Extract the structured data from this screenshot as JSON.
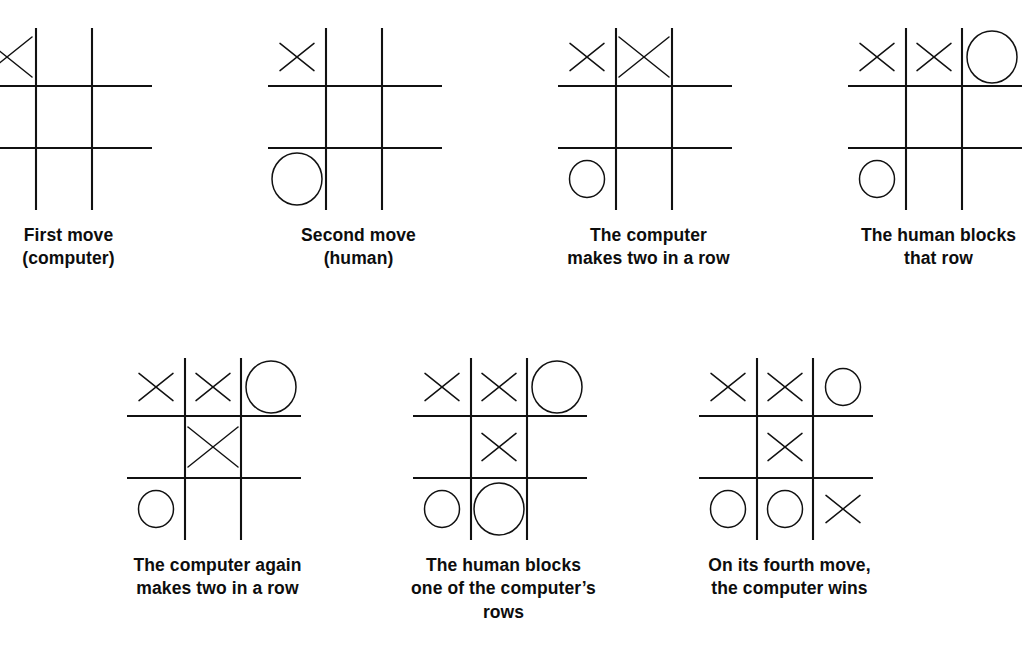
{
  "figure": {
    "background_color": "#ffffff",
    "ink_color": "#111111",
    "mark_x": "X",
    "mark_o": "O",
    "rows": [
      {
        "name": "top-row",
        "panel_count": 4
      },
      {
        "name": "bottom-row",
        "panel_count": 3
      }
    ]
  },
  "panels": [
    {
      "id": "panel-1",
      "caption_lines": [
        "First move",
        "(computer)"
      ],
      "caption_text": "First move (computer)",
      "cells": [
        {
          "cell": "top-left",
          "mark": "X",
          "size": "large"
        },
        {
          "cell": "top-center",
          "mark": "",
          "size": ""
        },
        {
          "cell": "top-right",
          "mark": "",
          "size": ""
        },
        {
          "cell": "middle-left",
          "mark": "",
          "size": ""
        },
        {
          "cell": "middle-center",
          "mark": "",
          "size": ""
        },
        {
          "cell": "middle-right",
          "mark": "",
          "size": ""
        },
        {
          "cell": "bottom-left",
          "mark": "",
          "size": ""
        },
        {
          "cell": "bottom-center",
          "mark": "",
          "size": ""
        },
        {
          "cell": "bottom-right",
          "mark": "",
          "size": ""
        }
      ]
    },
    {
      "id": "panel-2",
      "caption_lines": [
        "Second move",
        "(human)"
      ],
      "caption_text": "Second move (human)",
      "cells": [
        {
          "cell": "top-left",
          "mark": "X",
          "size": "small"
        },
        {
          "cell": "top-center",
          "mark": "",
          "size": ""
        },
        {
          "cell": "top-right",
          "mark": "",
          "size": ""
        },
        {
          "cell": "middle-left",
          "mark": "",
          "size": ""
        },
        {
          "cell": "middle-center",
          "mark": "",
          "size": ""
        },
        {
          "cell": "middle-right",
          "mark": "",
          "size": ""
        },
        {
          "cell": "bottom-left",
          "mark": "O",
          "size": "large"
        },
        {
          "cell": "bottom-center",
          "mark": "",
          "size": ""
        },
        {
          "cell": "bottom-right",
          "mark": "",
          "size": ""
        }
      ]
    },
    {
      "id": "panel-3",
      "caption_lines": [
        "The computer",
        "makes two in a row"
      ],
      "caption_text": "The computer makes two in a row",
      "cells": [
        {
          "cell": "top-left",
          "mark": "X",
          "size": "small"
        },
        {
          "cell": "top-center",
          "mark": "X",
          "size": "large"
        },
        {
          "cell": "top-right",
          "mark": "",
          "size": ""
        },
        {
          "cell": "middle-left",
          "mark": "",
          "size": ""
        },
        {
          "cell": "middle-center",
          "mark": "",
          "size": ""
        },
        {
          "cell": "middle-right",
          "mark": "",
          "size": ""
        },
        {
          "cell": "bottom-left",
          "mark": "O",
          "size": "small"
        },
        {
          "cell": "bottom-center",
          "mark": "",
          "size": ""
        },
        {
          "cell": "bottom-right",
          "mark": "",
          "size": ""
        }
      ]
    },
    {
      "id": "panel-4",
      "caption_lines": [
        "The human blocks",
        "that row"
      ],
      "caption_text": "The human blocks that row",
      "cells": [
        {
          "cell": "top-left",
          "mark": "X",
          "size": "small"
        },
        {
          "cell": "top-center",
          "mark": "X",
          "size": "small"
        },
        {
          "cell": "top-right",
          "mark": "O",
          "size": "large"
        },
        {
          "cell": "middle-left",
          "mark": "",
          "size": ""
        },
        {
          "cell": "middle-center",
          "mark": "",
          "size": ""
        },
        {
          "cell": "middle-right",
          "mark": "",
          "size": ""
        },
        {
          "cell": "bottom-left",
          "mark": "O",
          "size": "small"
        },
        {
          "cell": "bottom-center",
          "mark": "",
          "size": ""
        },
        {
          "cell": "bottom-right",
          "mark": "",
          "size": ""
        }
      ]
    },
    {
      "id": "panel-5",
      "caption_lines": [
        "The computer again",
        "makes two in a row"
      ],
      "caption_text": "The computer again makes two in a row",
      "cells": [
        {
          "cell": "top-left",
          "mark": "X",
          "size": "small"
        },
        {
          "cell": "top-center",
          "mark": "X",
          "size": "small"
        },
        {
          "cell": "top-right",
          "mark": "O",
          "size": "large"
        },
        {
          "cell": "middle-left",
          "mark": "",
          "size": ""
        },
        {
          "cell": "middle-center",
          "mark": "X",
          "size": "large"
        },
        {
          "cell": "middle-right",
          "mark": "",
          "size": ""
        },
        {
          "cell": "bottom-left",
          "mark": "O",
          "size": "small"
        },
        {
          "cell": "bottom-center",
          "mark": "",
          "size": ""
        },
        {
          "cell": "bottom-right",
          "mark": "",
          "size": ""
        }
      ]
    },
    {
      "id": "panel-6",
      "caption_lines": [
        "The human blocks",
        "one of the computer’s",
        "rows"
      ],
      "caption_text": "The human blocks one of the computer’s rows",
      "cells": [
        {
          "cell": "top-left",
          "mark": "X",
          "size": "small"
        },
        {
          "cell": "top-center",
          "mark": "X",
          "size": "small"
        },
        {
          "cell": "top-right",
          "mark": "O",
          "size": "large"
        },
        {
          "cell": "middle-left",
          "mark": "",
          "size": ""
        },
        {
          "cell": "middle-center",
          "mark": "X",
          "size": "small"
        },
        {
          "cell": "middle-right",
          "mark": "",
          "size": ""
        },
        {
          "cell": "bottom-left",
          "mark": "O",
          "size": "small"
        },
        {
          "cell": "bottom-center",
          "mark": "O",
          "size": "large"
        },
        {
          "cell": "bottom-right",
          "mark": "",
          "size": ""
        }
      ]
    },
    {
      "id": "panel-7",
      "caption_lines": [
        "On its fourth move,",
        "the computer wins"
      ],
      "caption_text": "On its fourth move, the computer wins",
      "cells": [
        {
          "cell": "top-left",
          "mark": "X",
          "size": "small"
        },
        {
          "cell": "top-center",
          "mark": "X",
          "size": "small"
        },
        {
          "cell": "top-right",
          "mark": "O",
          "size": "small"
        },
        {
          "cell": "middle-left",
          "mark": "",
          "size": ""
        },
        {
          "cell": "middle-center",
          "mark": "X",
          "size": "small"
        },
        {
          "cell": "middle-right",
          "mark": "",
          "size": ""
        },
        {
          "cell": "bottom-left",
          "mark": "O",
          "size": "small"
        },
        {
          "cell": "bottom-center",
          "mark": "O",
          "size": "small"
        },
        {
          "cell": "bottom-right",
          "mark": "X",
          "size": "small"
        }
      ]
    }
  ]
}
